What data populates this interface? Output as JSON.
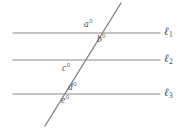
{
  "figure": {
    "background_color": "#ffffff",
    "line_color": "#8a8a8a",
    "transversal_color": "#7d7d7d",
    "label_color": "#4a4a4a"
  },
  "chart_data": {
    "type": "diagram",
    "parallel_lines": [
      {
        "name": "l1",
        "label": "ℓ",
        "subscript": "1",
        "x1": 13,
        "y1": 33,
        "x2": 160,
        "y2": 33
      },
      {
        "name": "l2",
        "label": "ℓ",
        "subscript": "2",
        "x1": 13,
        "y1": 60,
        "x2": 160,
        "y2": 60
      },
      {
        "name": "l3",
        "label": "ℓ",
        "subscript": "3",
        "x1": 13,
        "y1": 94,
        "x2": 160,
        "y2": 94
      }
    ],
    "transversal": {
      "name": "transversal",
      "x1": 121,
      "y1": 3,
      "x2": 45,
      "y2": 126
    },
    "angle_labels": [
      {
        "name": "a",
        "text": "a°",
        "x": 84,
        "y": 20,
        "position": "above-l1-left-of-transversal"
      },
      {
        "name": "b",
        "text": "b°",
        "x": 97,
        "y": 35,
        "position": "below-l1-right-of-transversal"
      },
      {
        "name": "c",
        "text": "c°",
        "x": 62,
        "y": 64,
        "position": "below-l2-left-of-transversal"
      },
      {
        "name": "d",
        "text": "d°",
        "x": 68,
        "y": 83,
        "position": "above-l3-right-of-transversal"
      },
      {
        "name": "e",
        "text": "e°",
        "x": 61,
        "y": 96,
        "position": "below-l3-left-of-transversal"
      }
    ]
  },
  "labels": {
    "a": "a°",
    "b": "b°",
    "c": "c°",
    "d": "d°",
    "e": "e°",
    "l1": "ℓ",
    "l1_sub": "1",
    "l2": "ℓ",
    "l2_sub": "2",
    "l3": "ℓ",
    "l3_sub": "3"
  }
}
